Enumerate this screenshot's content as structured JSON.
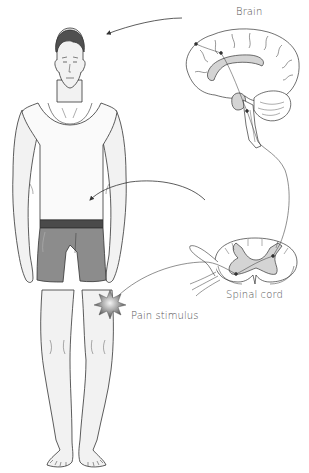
{
  "diagram": {
    "type": "anatomical-pain-pathway",
    "labels": {
      "brain": "Brain",
      "spinal_cord": "Spinal cord",
      "pain_stimulus": "Pain stimulus"
    },
    "nodes": [
      {
        "id": "pain_stimulus",
        "label": "Pain stimulus",
        "location": "right knee"
      },
      {
        "id": "spinal_cord",
        "label": "Spinal cord",
        "depiction": "cross-section"
      },
      {
        "id": "brain",
        "label": "Brain",
        "depiction": "sagittal section"
      }
    ],
    "edges": [
      {
        "from": "pain_stimulus",
        "to": "spinal_cord",
        "kind": "sensory-nerve"
      },
      {
        "from": "spinal_cord",
        "to": "brain",
        "kind": "ascending-pathway"
      },
      {
        "from": "brain",
        "to": "body-head",
        "kind": "arrow"
      },
      {
        "from": "spinal_cord",
        "to": "body-torso",
        "kind": "arrow"
      }
    ],
    "colors": {
      "outline": "#333333",
      "skin": "#f2f2f2",
      "hair": "#505050",
      "shorts": "#8c8c8c",
      "waistband": "#4a4a4a",
      "grey_matter": "#d4d4d4",
      "stimulus": "#777777",
      "label_text": "#555555"
    }
  }
}
